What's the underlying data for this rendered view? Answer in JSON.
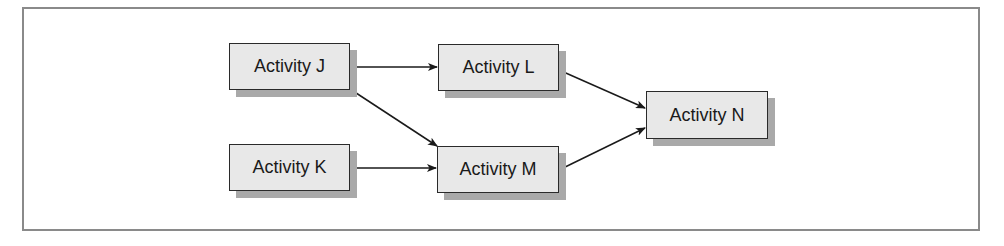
{
  "diagram": {
    "type": "activity-network",
    "nodes": [
      {
        "id": "J",
        "label": "Activity J"
      },
      {
        "id": "K",
        "label": "Activity K"
      },
      {
        "id": "L",
        "label": "Activity L"
      },
      {
        "id": "M",
        "label": "Activity M"
      },
      {
        "id": "N",
        "label": "Activity N"
      }
    ],
    "edges": [
      {
        "from": "J",
        "to": "L"
      },
      {
        "from": "J",
        "to": "M"
      },
      {
        "from": "K",
        "to": "M"
      },
      {
        "from": "L",
        "to": "N"
      },
      {
        "from": "M",
        "to": "N"
      }
    ],
    "colors": {
      "node_fill": "#e8e8e8",
      "node_border": "#2a2a2a",
      "node_shadow": "#a9a9a9",
      "frame_border": "#8a8a8a",
      "edge": "#1a1a1a"
    }
  }
}
